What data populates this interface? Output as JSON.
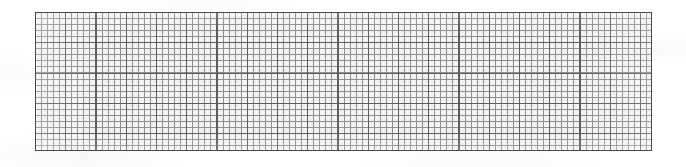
{
  "page": {
    "background_color": "#ffffff",
    "width": 686,
    "height": 167,
    "caption": ""
  },
  "grid_sheet": {
    "name": "graph-paper-sheet",
    "background_color": "#f4f3f1",
    "border_color": "#4a4a4a",
    "minor_line_color": "#8e8e8e",
    "major_line_color": "#5d5d5d",
    "left": 35,
    "top": 12,
    "width": 617,
    "height": 139,
    "cell_size_px": 6.05,
    "major_every_n_cells": 5,
    "columns": 102,
    "rows": 23,
    "label": ""
  },
  "chart_data": {
    "type": "table",
    "title": "",
    "xlabel": "",
    "ylabel": "",
    "categories": [],
    "values": [],
    "grid": true,
    "legend": "none"
  }
}
